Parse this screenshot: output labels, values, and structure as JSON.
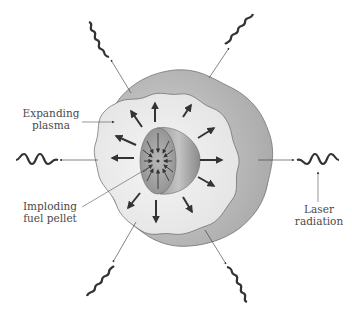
{
  "figure": {
    "labels": {
      "expanding_plasma": [
        "Expanding",
        "plasma"
      ],
      "imploding_pellet": [
        "Imploding",
        "fuel pellet"
      ],
      "laser_radiation": [
        "Laser",
        "radiation"
      ]
    },
    "colors": {
      "background": "#ffffff",
      "plasma_outer_shell": "#b9b9b9",
      "plasma_inner": "#ececec",
      "pellet_face": "#a9a9a9",
      "pellet_side": "#8c8c8c",
      "arrows": "#3a3a3a",
      "leader_lines": "#555555",
      "text": "#4a4a4a"
    },
    "laser_beams": [
      {
        "id": "top-left",
        "wave_start": [
          90,
          15
        ],
        "arrow_tip": [
          128,
          90
        ]
      },
      {
        "id": "top-right",
        "wave_start": [
          255,
          12
        ],
        "arrow_tip": [
          208,
          78
        ]
      },
      {
        "id": "left",
        "wave_start": [
          15,
          160
        ],
        "arrow_tip": [
          95,
          158
        ]
      },
      {
        "id": "right",
        "wave_start": [
          340,
          160
        ],
        "arrow_tip": [
          260,
          160
        ]
      },
      {
        "id": "bottom-left",
        "wave_start": [
          90,
          298
        ],
        "arrow_tip": [
          130,
          222
        ]
      },
      {
        "id": "bottom-right",
        "wave_start": [
          245,
          300
        ],
        "arrow_tip": [
          205,
          228
        ]
      }
    ],
    "outward_arrow_count": 12,
    "inward_arrow_count": 12
  }
}
